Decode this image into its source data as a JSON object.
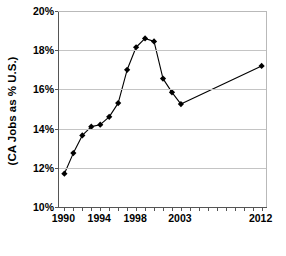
{
  "chart_data": {
    "type": "line",
    "title": "",
    "subtitle": "",
    "xlabel": "",
    "ylabel": "(CA Jobs as % U.S.)",
    "xlim": [
      1989.4,
      2012.6
    ],
    "ylim": [
      10,
      20
    ],
    "grid": true,
    "legend": false,
    "legend_position": "none",
    "y_ticks": [
      {
        "value": 10,
        "label": "10%"
      },
      {
        "value": 12,
        "label": "12%"
      },
      {
        "value": 14,
        "label": "14%"
      },
      {
        "value": 16,
        "label": "16%"
      },
      {
        "value": 18,
        "label": "18%"
      },
      {
        "value": 20,
        "label": "20%"
      }
    ],
    "x_ticks": [
      1990,
      1991,
      1992,
      1993,
      1994,
      1995,
      1996,
      1997,
      1998,
      1999,
      2000,
      2001,
      2002,
      2003,
      2004,
      2005,
      2006,
      2007,
      2008,
      2009,
      2010,
      2011,
      2012
    ],
    "x_tick_labels": [
      {
        "value": 1990,
        "label": "1990"
      },
      {
        "value": 1994,
        "label": "1994"
      },
      {
        "value": 1998,
        "label": "1998"
      },
      {
        "value": 2003,
        "label": "2003"
      },
      {
        "value": 2012,
        "label": "2012"
      }
    ],
    "series": [
      {
        "name": "CA Jobs as % U.S.",
        "color": "#000000",
        "marker": "diamond",
        "x": [
          1990,
          1991,
          1992,
          1993,
          1994,
          1995,
          1996,
          1997,
          1998,
          1999,
          2000,
          2001,
          2002,
          2003,
          2012
        ],
        "values": [
          11.7,
          12.75,
          13.65,
          14.1,
          14.2,
          14.6,
          15.3,
          17.0,
          18.15,
          18.6,
          18.45,
          16.55,
          15.85,
          15.25,
          17.2
        ]
      }
    ],
    "annotations": []
  },
  "axis": {
    "y_title": "(CA Jobs as % U.S.)"
  }
}
